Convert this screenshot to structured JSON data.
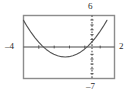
{
  "chart_data": {
    "type": "line",
    "title": "",
    "xlabel": "",
    "ylabel": "",
    "grid": false,
    "legend": null,
    "window_labels": {
      "ymax": "6",
      "xmin": "–4",
      "xmax": "2",
      "ymin": "–7"
    },
    "xlim": [
      -4,
      2
    ],
    "ylim": [
      -7,
      6
    ],
    "axes": {
      "x_axis_visible": true,
      "x_axis_style": "solid",
      "y_axis_visible": true,
      "y_axis_style": "dotted",
      "x_axis_at_y": 0,
      "y_axis_at_x": 0,
      "x_tick_count": 6,
      "y_tick_count": 13
    },
    "series": [
      {
        "name": "parabola",
        "color": "#555555",
        "points": [
          {
            "x": -4.0,
            "y": 5.0
          },
          {
            "x": -3.75,
            "y": 3.69
          },
          {
            "x": -3.5,
            "y": 2.5
          },
          {
            "x": -3.25,
            "y": 1.44
          },
          {
            "x": -3.0,
            "y": 0.5
          },
          {
            "x": -2.75,
            "y": -0.31
          },
          {
            "x": -2.5,
            "y": -1.0
          },
          {
            "x": -2.25,
            "y": -1.56
          },
          {
            "x": -2.0,
            "y": -2.0
          },
          {
            "x": -1.75,
            "y": -2.31
          },
          {
            "x": -1.5,
            "y": -2.5
          },
          {
            "x": -1.25,
            "y": -2.56
          },
          {
            "x": -1.0,
            "y": -2.5
          },
          {
            "x": -0.75,
            "y": -2.31
          },
          {
            "x": -0.5,
            "y": -2.0
          },
          {
            "x": -0.25,
            "y": -1.56
          },
          {
            "x": 0.0,
            "y": -1.0
          },
          {
            "x": 0.25,
            "y": -0.31
          },
          {
            "x": 0.5,
            "y": 0.5
          },
          {
            "x": 0.75,
            "y": 1.44
          },
          {
            "x": 1.0,
            "y": 2.5
          },
          {
            "x": 1.25,
            "y": 3.69
          },
          {
            "x": 1.5,
            "y": 5.0
          }
        ],
        "vertex": {
          "x": -1.25,
          "y": -2.56
        },
        "x_intercepts": [
          -2.85,
          0.35
        ]
      }
    ],
    "colors": {
      "frame": "#8c8c8c",
      "axis": "#4a4a4a",
      "curve": "#555555",
      "label_text": "#2a2a2a",
      "background": "#ffffff"
    }
  }
}
